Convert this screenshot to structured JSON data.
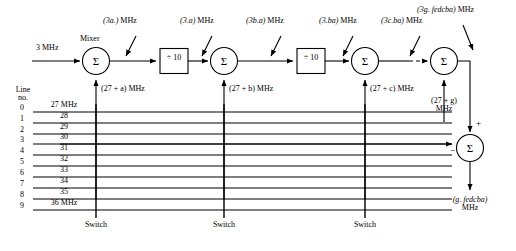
{
  "diagram": {
    "input": {
      "label": "3 MHz"
    },
    "mixer_caption": "Mixer",
    "line_header": {
      "line": "Line",
      "no": "no."
    },
    "divider_label": "÷ 10",
    "summer_symbol": "Σ",
    "plus_sign": "+",
    "minus_sign": "−",
    "switch_label": "Switch",
    "output": {
      "value": "(g. fedcba)",
      "unit": "MHz"
    },
    "stage_signals": [
      {
        "id": "sig-1",
        "value": "(3a.)",
        "unit": "MHz"
      },
      {
        "id": "sig-2",
        "value": "(3.a)",
        "unit": "MHz"
      },
      {
        "id": "sig-3",
        "value": "(3b.a)",
        "unit": "MHz"
      },
      {
        "id": "sig-4",
        "value": "(3.ba)",
        "unit": "MHz"
      },
      {
        "id": "sig-5",
        "value": "(3c.ba)",
        "unit": "MHz"
      },
      {
        "id": "sig-6",
        "value": "(3g. fedcba)",
        "unit": "MHz"
      }
    ],
    "switch_feeds": [
      {
        "id": "feed-a",
        "value": "(27 + a)",
        "unit": "MHz"
      },
      {
        "id": "feed-b",
        "value": "(27 + b)",
        "unit": "MHz"
      },
      {
        "id": "feed-c",
        "value": "(27 + c)",
        "unit": "MHz"
      },
      {
        "id": "feed-g",
        "value": "(27 + g)",
        "unit": "MHz"
      }
    ],
    "lines": [
      {
        "no": "0",
        "freq": "27 MHz"
      },
      {
        "no": "1",
        "freq": "28"
      },
      {
        "no": "2",
        "freq": "29"
      },
      {
        "no": "3",
        "freq": "30"
      },
      {
        "no": "4",
        "freq": "31"
      },
      {
        "no": "5",
        "freq": "32"
      },
      {
        "no": "6",
        "freq": "33"
      },
      {
        "no": "7",
        "freq": "34"
      },
      {
        "no": "8",
        "freq": "35"
      },
      {
        "no": "9",
        "freq": "36 MHz"
      }
    ],
    "switches": [
      {
        "id": "switch-1",
        "label": "Switch"
      },
      {
        "id": "switch-2",
        "label": "Switch"
      },
      {
        "id": "switch-3",
        "label": "Switch"
      }
    ],
    "colors": {
      "ink": "#000000",
      "paper": "#ffffff"
    }
  }
}
